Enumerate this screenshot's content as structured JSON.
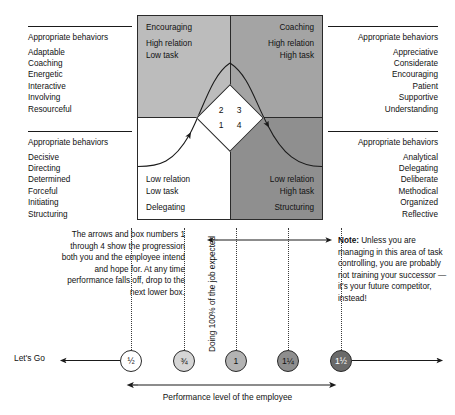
{
  "behaviors": {
    "top_left": {
      "heading": "Appropriate behaviors",
      "items": [
        "Adaptable",
        "Coaching",
        "Energetic",
        "Interactive",
        "Involving",
        "Resourceful"
      ]
    },
    "bottom_left": {
      "heading": "Appropriate behaviors",
      "items": [
        "Decisive",
        "Directing",
        "Determined",
        "Forceful",
        "Initiating",
        "Structuring"
      ]
    },
    "top_right": {
      "heading": "Appropriate behaviors",
      "items": [
        "Appreciative",
        "Considerate",
        "Encouraging",
        "Patient",
        "Supportive",
        "Understanding"
      ]
    },
    "bottom_right": {
      "heading": "Appropriate behaviors",
      "items": [
        "Analytical",
        "Delegating",
        "Deliberate",
        "Methodical",
        "Organized",
        "Reflective"
      ]
    }
  },
  "matrix": {
    "quadrants": [
      {
        "id": "coaching",
        "title": "Coaching",
        "line1": "High relation",
        "line2": "High task",
        "line3": "",
        "fill": "#bcbcbc"
      },
      {
        "id": "encouraging",
        "title": "Encouraging",
        "line1": "High relation",
        "line2": "Low task",
        "line3": "",
        "fill": "#a4a4a4"
      },
      {
        "id": "structuring",
        "title": "",
        "line1": "Low relation",
        "line2": "High task",
        "line3": "Structuring",
        "fill": "#ffffff"
      },
      {
        "id": "delegating",
        "title": "",
        "line1": "Low relation",
        "line2": "Low task",
        "line3": "Delegating",
        "fill": "#8f8f8f"
      }
    ],
    "diamond_numbers": [
      "2",
      "3",
      "1",
      "4"
    ]
  },
  "annotations": {
    "left_note": "The arrows and box numbers 1 through 4 show the progression both you and the employee intend and hope for. At any time performance falls off, drop to the next lower box.",
    "right_note_label": "Note:",
    "right_note": " Unless you are managing in this area of task controlling, you are probably not training your successor —it's your future competitor, instead!",
    "vertical_label": "Doing 100% of the job expected",
    "lets_go": "Let's Go",
    "axis_caption": "Performance level of the employee"
  },
  "axis": {
    "markers": [
      {
        "label": "½",
        "fill": "#ffffff",
        "text_color": "#111111",
        "x": 131
      },
      {
        "label": "¾",
        "fill": "#d5d5d5",
        "text_color": "#111111",
        "x": 184
      },
      {
        "label": "1",
        "fill": "#b3b3b3",
        "text_color": "#111111",
        "x": 236
      },
      {
        "label": "1¼",
        "fill": "#8e8e8e",
        "text_color": "#111111",
        "x": 288
      },
      {
        "label": "1½",
        "fill": "#6a6a6a",
        "text_color": "#ffffff",
        "x": 341
      }
    ]
  },
  "colors": {
    "stroke": "#2a2a2a",
    "text": "#111111",
    "dot": "#3a3a3a"
  }
}
